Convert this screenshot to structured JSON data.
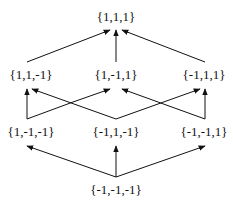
{
  "diagram": {
    "type": "lattice / Hasse diagram",
    "colors": {
      "text": "#111111",
      "edge": "#111111",
      "background": "#ffffff"
    },
    "nodes": {
      "top": "{1,1,1}",
      "l2_left": "{1,1,-1}",
      "l2_mid": "{1,-1,1}",
      "l2_right": "{-1,1,1}",
      "l1_left": "{1,-1,-1}",
      "l1_mid": "{-1,1,-1}",
      "l1_right": "{-1,-1,1}",
      "bottom": "{-1,-1,-1}"
    },
    "edges": [
      [
        "bottom",
        "l1_left"
      ],
      [
        "bottom",
        "l1_mid"
      ],
      [
        "bottom",
        "l1_right"
      ],
      [
        "l1_left",
        "l2_left"
      ],
      [
        "l1_left",
        "l2_mid"
      ],
      [
        "l1_mid",
        "l2_left"
      ],
      [
        "l1_mid",
        "l2_right"
      ],
      [
        "l1_right",
        "l2_mid"
      ],
      [
        "l1_right",
        "l2_right"
      ],
      [
        "l2_left",
        "top"
      ],
      [
        "l2_mid",
        "top"
      ],
      [
        "l2_right",
        "top"
      ]
    ]
  }
}
